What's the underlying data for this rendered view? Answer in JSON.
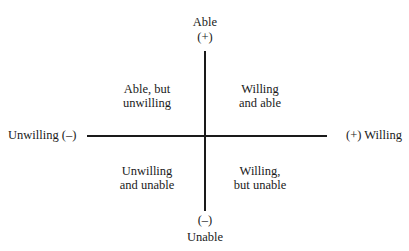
{
  "diagram": {
    "type": "quadrant",
    "axes": {
      "vertical": {
        "top_label": "Able",
        "top_sign": "(+)",
        "bottom_sign": "(–)",
        "bottom_label": "Unable"
      },
      "horizontal": {
        "left_label": "Unwilling (–)",
        "right_label": "(+) Willing"
      }
    },
    "quadrants": {
      "top_left": {
        "line1": "Able, but",
        "line2": "unwilling"
      },
      "top_right": {
        "line1": "Willing",
        "line2": "and able"
      },
      "bottom_left": {
        "line1": "Unwilling",
        "line2": "and unable"
      },
      "bottom_right": {
        "line1": "Willing,",
        "line2": "but unable"
      }
    },
    "colors": {
      "line": "#1a1a1a",
      "text": "#1a1a1a",
      "background": "#ffffff"
    }
  }
}
